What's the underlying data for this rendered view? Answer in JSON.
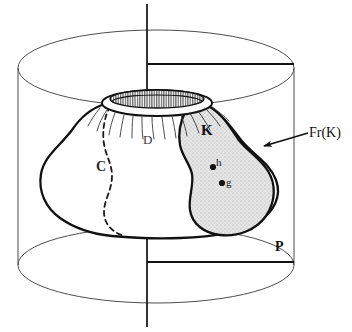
{
  "figure": {
    "background_color": "#ffffff",
    "stroke_color": "#111111",
    "thin_stroke_color": "#5a5a5a",
    "shade_fill": "#e0e0e0",
    "width": 352,
    "height": 332
  },
  "labels": {
    "k": "K",
    "c": "C",
    "d": "D",
    "p": "P",
    "h": "h",
    "g": "g",
    "frontier": "Fr(K)"
  },
  "points": [
    {
      "name": "h",
      "label": "h",
      "x": 213,
      "y": 167
    },
    {
      "name": "g",
      "label": "g",
      "x": 222,
      "y": 183
    }
  ],
  "annotations": [
    {
      "name": "frontier-callout",
      "label": "Fr(K)",
      "arrow_from_x": 306,
      "arrow_from_y": 134,
      "arrow_to_x": 263,
      "arrow_to_y": 146
    }
  ],
  "elements": {
    "cylinder": "cylinder",
    "axis": "vertical-axis",
    "plane_top_trace": "top-plane-trace",
    "plane_bottom_trace": "bottom-plane-trace",
    "funnel": "funnel-surface",
    "region_k": "shaded-region-k",
    "curve_c": "dashed-curve-c"
  }
}
